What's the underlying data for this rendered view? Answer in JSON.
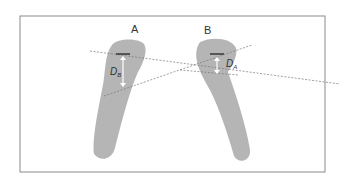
{
  "figure": {
    "labels": {
      "left": "A",
      "right": "B"
    },
    "measures": {
      "left": "D_B",
      "right": "D_A"
    },
    "measure_main": {
      "left": "D",
      "right": "D"
    },
    "measure_sub": {
      "left": "B",
      "right": "A"
    },
    "colors": {
      "frame": "#8a8a8a",
      "shape": "#b4b4b4",
      "line": "#777777",
      "arrow": "#ffffff"
    }
  }
}
